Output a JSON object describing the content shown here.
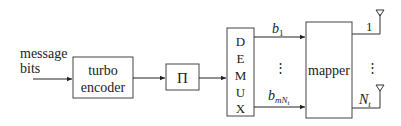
{
  "diagram": {
    "input_label_line1": "message",
    "input_label_line2": "bits",
    "blocks": {
      "encoder_line1": "turbo",
      "encoder_line2": "encoder",
      "interleaver": "Π",
      "demux_letters": [
        "D",
        "E",
        "M",
        "U",
        "X"
      ],
      "mapper": "mapper"
    },
    "streams": {
      "first": "b",
      "first_sub": "1",
      "last": "b",
      "last_sub": "mN",
      "last_subsub": "t",
      "dots": "⋮"
    },
    "antennas": {
      "first": "1",
      "last": "N",
      "last_sub": "t",
      "dots": "⋮"
    }
  }
}
